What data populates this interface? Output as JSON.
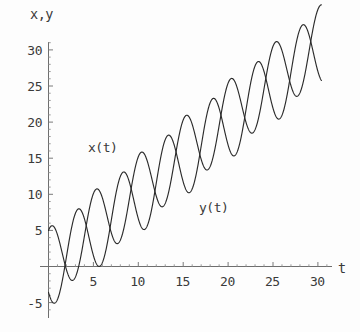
{
  "chart_data": {
    "type": "line",
    "title": "",
    "subtitle": "",
    "xlabel": "t",
    "ylabel": "x,y",
    "xlim": [
      0,
      31.5
    ],
    "ylim": [
      -6.5,
      32.5
    ],
    "xticks": [
      5,
      10,
      15,
      20,
      25,
      30
    ],
    "yticks": [
      -5,
      5,
      10,
      15,
      20,
      25,
      30
    ],
    "xtick_labels": [
      "5",
      "10",
      "15",
      "20",
      "25",
      "30"
    ],
    "ytick_labels": [
      "-5",
      "5",
      "10",
      "15",
      "20",
      "25",
      "30"
    ],
    "grid": false,
    "legend_position": "inline-annotations",
    "annotations": [
      {
        "text": "x(t)",
        "t": 5.0,
        "value": 15.5
      },
      {
        "text": "y(t)",
        "t": 17.0,
        "value": 7.5
      }
    ],
    "series": [
      {
        "name": "x(t)",
        "color": "#2b2b2b",
        "model": "linear trend plus sinusoid",
        "trend_intercept": 0.3,
        "trend_slope": 1.02,
        "amplitude": 5.0,
        "period": 5.0,
        "phase_deg": 70,
        "t_start": 0.0,
        "t_end": 30.4,
        "x": [
          0,
          1,
          2,
          3,
          4,
          5,
          6,
          7,
          8,
          9,
          10,
          11,
          12,
          13,
          14,
          15,
          16,
          17,
          18,
          19,
          20,
          21,
          22,
          23,
          24,
          25,
          26,
          27,
          28,
          29,
          30
        ],
        "values": [
          5.0,
          1.3,
          -2.1,
          -1.2,
          3.3,
          8.4,
          9.9,
          7.6,
          6.3,
          8.8,
          13.8,
          17.6,
          17.3,
          14.2,
          13.1,
          15.8,
          20.6,
          24.0,
          23.7,
          20.9,
          20.0,
          22.6,
          27.4,
          30.6,
          30.1,
          27.2,
          26.3,
          29.0,
          33.5,
          36.5,
          36.0
        ]
      },
      {
        "name": "y(t)",
        "color": "#2b2b2b",
        "model": "linear trend plus sinusoid",
        "trend_intercept": -0.6,
        "trend_slope": 1.02,
        "amplitude": 5.2,
        "period": 5.0,
        "phase_deg": 215,
        "t_start": 0.0,
        "t_end": 30.4,
        "x": [
          0,
          1,
          2,
          3,
          4,
          5,
          6,
          7,
          8,
          9,
          10,
          11,
          12,
          13,
          14,
          15,
          16,
          17,
          18,
          19,
          20,
          21,
          22,
          23,
          24,
          25,
          26,
          27,
          28,
          29,
          30
        ],
        "values": [
          -3.6,
          -5.6,
          -3.5,
          1.2,
          6.0,
          7.7,
          6.1,
          3.3,
          2.3,
          4.9,
          9.9,
          13.5,
          13.0,
          9.9,
          8.3,
          10.2,
          14.9,
          18.5,
          18.4,
          15.6,
          14.0,
          15.8,
          20.3,
          23.8,
          23.7,
          20.9,
          19.4,
          21.1,
          25.5,
          29.0,
          29.0
        ]
      }
    ]
  },
  "figure": {
    "background_color": "#fdfdfd",
    "curve_color": "#2b2b2b",
    "axis_color": "#6e6e6e",
    "text_color": "#3a3a3a"
  }
}
